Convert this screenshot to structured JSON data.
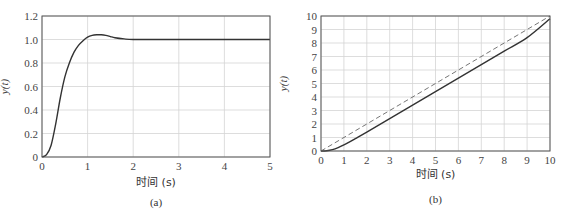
{
  "chart_data": [
    {
      "id": "a",
      "type": "line",
      "caption": "(a)",
      "title": "",
      "xlabel": "时间 (s)",
      "ylabel": "y(t)",
      "xlim": [
        0,
        5
      ],
      "ylim": [
        0,
        1.2
      ],
      "xticks": [
        "0",
        "1",
        "2",
        "3",
        "4",
        "5"
      ],
      "yticks": [
        "0",
        "0.2",
        "0.4",
        "0.6",
        "0.8",
        "1.0",
        "1.2"
      ],
      "grid": true,
      "series": [
        {
          "name": "step response",
          "style": "solid",
          "x": [
            0,
            0.1,
            0.2,
            0.3,
            0.4,
            0.5,
            0.6,
            0.7,
            0.8,
            0.9,
            1.0,
            1.1,
            1.2,
            1.3,
            1.4,
            1.5,
            1.6,
            1.8,
            2.0,
            2.5,
            3.0,
            4.0,
            5.0
          ],
          "y": [
            0,
            0.02,
            0.1,
            0.28,
            0.5,
            0.68,
            0.8,
            0.89,
            0.95,
            0.99,
            1.02,
            1.035,
            1.04,
            1.04,
            1.035,
            1.025,
            1.015,
            1.005,
            1.0,
            1.0,
            1.0,
            1.0,
            1.0
          ]
        }
      ]
    },
    {
      "id": "b",
      "type": "line",
      "caption": "(b)",
      "title": "",
      "xlabel": "时间 (s)",
      "ylabel": "y(t)",
      "xlim": [
        0,
        10
      ],
      "ylim": [
        0,
        10
      ],
      "xticks": [
        "0",
        "1",
        "2",
        "3",
        "4",
        "5",
        "6",
        "7",
        "8",
        "9",
        "10"
      ],
      "yticks": [
        "0",
        "1",
        "2",
        "3",
        "4",
        "5",
        "6",
        "7",
        "8",
        "9",
        "10"
      ],
      "grid": true,
      "series": [
        {
          "name": "ramp response",
          "style": "solid",
          "x": [
            0,
            0.25,
            0.5,
            0.75,
            1.0,
            1.25,
            1.5,
            2,
            3,
            4,
            5,
            6,
            7,
            8,
            9,
            10
          ],
          "y": [
            0,
            0.02,
            0.1,
            0.25,
            0.45,
            0.68,
            0.92,
            1.4,
            2.4,
            3.4,
            4.4,
            5.4,
            6.4,
            7.4,
            8.4,
            9.8
          ]
        },
        {
          "name": "ramp input",
          "style": "dashed",
          "x": [
            0,
            10
          ],
          "y": [
            0,
            10
          ]
        }
      ]
    }
  ]
}
